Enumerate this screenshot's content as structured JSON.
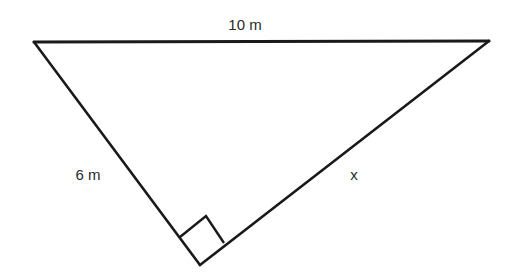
{
  "diagram": {
    "type": "right-triangle",
    "stroke_color": "#1a1a1a",
    "vertices": {
      "top_left": [
        34,
        42
      ],
      "top_right": [
        489,
        41
      ],
      "right_angle": [
        200,
        265
      ]
    },
    "right_angle_marker": {
      "points": [
        [
          180,
          237
        ],
        [
          206,
          216
        ],
        [
          224,
          243
        ],
        [
          200,
          265
        ]
      ]
    },
    "labels": {
      "hypotenuse": "10 m",
      "left_leg": "6 m",
      "right_leg": "x"
    }
  }
}
